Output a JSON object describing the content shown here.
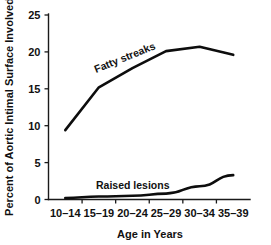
{
  "chart_data": {
    "type": "line",
    "title": "",
    "xlabel": "Age in Years",
    "ylabel": "Percent of Aortic Intimal Surface Involved",
    "categories": [
      "10–14",
      "15–19",
      "20–24",
      "25–29",
      "30–34",
      "35–39"
    ],
    "yticks": [
      "0",
      "5",
      "10",
      "15",
      "20",
      "25"
    ],
    "ytick_values": [
      0,
      5,
      10,
      15,
      20,
      25
    ],
    "ylim": [
      0,
      25
    ],
    "grid": false,
    "legend_position": "inline-annotation",
    "series": [
      {
        "name": "Fatty streaks",
        "values": [
          9.4,
          15.2,
          17.8,
          20.1,
          20.7,
          19.6
        ],
        "color": "#0d0d0d",
        "line_width": 2.6,
        "label_rotation": -22,
        "label_x": 96,
        "label_y": 73
      },
      {
        "name": "Raised lesions",
        "values": [
          0.2,
          0.4,
          0.5,
          0.8,
          1.8,
          3.3
        ],
        "color": "#0d0d0d",
        "line_width": 2.6,
        "label_rotation": 0,
        "label_x": 96,
        "label_y": 189
      }
    ]
  },
  "axes": {
    "y_title": "Percent of Aortic Intimal Surface Involved",
    "x_title": "Age in Years"
  }
}
